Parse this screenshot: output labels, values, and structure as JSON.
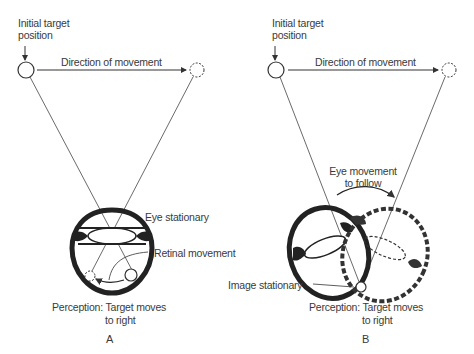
{
  "panels": [
    {
      "id": "A",
      "letter": "A",
      "initial_label_line1": "Initial target",
      "initial_label_line2": "position",
      "direction_label": "Direction of movement",
      "eye_label": "Eye stationary",
      "retina_label": "Retinal movement",
      "perception_line1": "Perception: Target moves",
      "perception_line2": "to right"
    },
    {
      "id": "B",
      "letter": "B",
      "initial_label_line1": "Initial target",
      "initial_label_line2": "position",
      "direction_label": "Direction of movement",
      "eye_move_line1": "Eye movement",
      "eye_move_line2": "to follow",
      "image_label": "Image stationary",
      "perception_line1": "Perception: Target moves",
      "perception_line2": "to right"
    }
  ],
  "colors": {
    "ink": "#333333",
    "background": "#ffffff"
  }
}
